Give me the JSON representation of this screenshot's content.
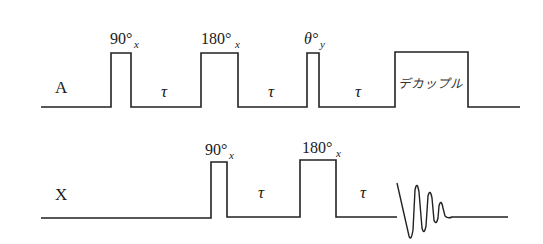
{
  "diagram": {
    "type": "pulse-sequence",
    "channels": [
      {
        "label": "A",
        "elements": [
          {
            "kind": "pulse",
            "angle": "90°",
            "phase": "x"
          },
          {
            "kind": "delay",
            "label": "τ"
          },
          {
            "kind": "pulse",
            "angle": "180°",
            "phase": "x"
          },
          {
            "kind": "delay",
            "label": "τ"
          },
          {
            "kind": "pulse",
            "angle": "θ°",
            "phase": "y"
          },
          {
            "kind": "delay",
            "label": "τ"
          },
          {
            "kind": "block",
            "label": "デカップル"
          }
        ]
      },
      {
        "label": "X",
        "elements": [
          {
            "kind": "pulse",
            "angle": "90°",
            "phase": "x"
          },
          {
            "kind": "delay",
            "label": "τ"
          },
          {
            "kind": "pulse",
            "angle": "180°",
            "phase": "x"
          },
          {
            "kind": "delay",
            "label": "τ"
          },
          {
            "kind": "acquisition",
            "label": "FID"
          }
        ]
      }
    ]
  },
  "labels": {
    "channel_a": "A",
    "channel_x": "X",
    "a_p1_angle": "90°",
    "a_p1_phase": "x",
    "a_p2_angle": "180°",
    "a_p2_phase": "x",
    "a_p3_angle": "θ°",
    "a_p3_phase": "y",
    "tau": "τ",
    "decouple": "デカップル",
    "x_p1_angle": "90°",
    "x_p1_phase": "x",
    "x_p2_angle": "180°",
    "x_p2_phase": "x"
  }
}
